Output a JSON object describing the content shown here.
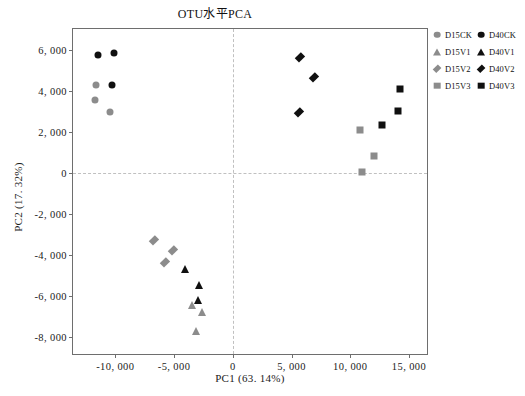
{
  "chart_data": {
    "type": "scatter",
    "title": "OTU水平PCA",
    "xlabel": "PC1 (63. 14%)",
    "ylabel": "PC2 (17. 32%)",
    "xlim": [
      -13600,
      16700
    ],
    "ylim": [
      -8900,
      7000
    ],
    "xticks": [
      -10000,
      -5000,
      0,
      5000,
      10000,
      15000
    ],
    "xtick_labels": [
      "-10, 000",
      "-5, 000",
      "0",
      "5, 000",
      "10, 000",
      "15, 000"
    ],
    "yticks": [
      -8000,
      -6000,
      -4000,
      -2000,
      0,
      2000,
      4000,
      6000
    ],
    "ytick_labels": [
      "-8, 000",
      "-6, 000",
      "-4, 000",
      "-2, 000",
      "0",
      "2, 000",
      "4, 000",
      "6, 000"
    ],
    "grid": false,
    "reference_lines": {
      "x": 0,
      "y": 0,
      "style": "dashed",
      "color": "#c0c0c0"
    },
    "legend_position": "right",
    "colors": {
      "d15": "#8c8c8c",
      "d40": "#101010",
      "axis": "#6e6e6e",
      "reference": "#c0c0c0"
    },
    "series": [
      {
        "name": "D15CK",
        "marker": "circle",
        "color": "#8c8c8c",
        "points": [
          [
            -11600,
            4280
          ],
          [
            -11700,
            3560
          ],
          [
            -10450,
            2980
          ]
        ]
      },
      {
        "name": "D15V1",
        "marker": "triangle",
        "color": "#8c8c8c",
        "points": [
          [
            -3450,
            -6430
          ],
          [
            -2600,
            -6780
          ],
          [
            -3100,
            -7700
          ]
        ]
      },
      {
        "name": "D15V2",
        "marker": "diamond",
        "color": "#8c8c8c",
        "points": [
          [
            -6700,
            -3270
          ],
          [
            -5750,
            -4320
          ],
          [
            -5050,
            -3760
          ]
        ]
      },
      {
        "name": "D15V3",
        "marker": "square",
        "color": "#8c8c8c",
        "points": [
          [
            10800,
            2100
          ],
          [
            12000,
            810
          ],
          [
            11000,
            30
          ]
        ]
      },
      {
        "name": "D40CK",
        "marker": "circle",
        "color": "#101010",
        "points": [
          [
            -11500,
            5760
          ],
          [
            -10100,
            5820
          ],
          [
            -10250,
            4290
          ]
        ]
      },
      {
        "name": "D40V1",
        "marker": "triangle",
        "color": "#101010",
        "points": [
          [
            -4050,
            -4680
          ],
          [
            -2900,
            -5470
          ],
          [
            -2950,
            -6180
          ]
        ]
      },
      {
        "name": "D40V2",
        "marker": "diamond",
        "color": "#101010",
        "points": [
          [
            5750,
            5640
          ],
          [
            6900,
            4680
          ],
          [
            5600,
            2940
          ]
        ]
      },
      {
        "name": "D40V3",
        "marker": "square",
        "color": "#101010",
        "points": [
          [
            14200,
            4060
          ],
          [
            12700,
            2350
          ],
          [
            14100,
            3020
          ]
        ]
      }
    ]
  },
  "legend": {
    "entries": [
      {
        "label": "D15CK",
        "marker": "circle",
        "color": "#8c8c8c"
      },
      {
        "label": "D40CK",
        "marker": "circle",
        "color": "#101010"
      },
      {
        "label": "D15V1",
        "marker": "triangle",
        "color": "#8c8c8c"
      },
      {
        "label": "D40V1",
        "marker": "triangle",
        "color": "#101010"
      },
      {
        "label": "D15V2",
        "marker": "diamond",
        "color": "#8c8c8c"
      },
      {
        "label": "D40V2",
        "marker": "diamond",
        "color": "#101010"
      },
      {
        "label": "D15V3",
        "marker": "square",
        "color": "#8c8c8c"
      },
      {
        "label": "D40V3",
        "marker": "square",
        "color": "#101010"
      }
    ]
  }
}
